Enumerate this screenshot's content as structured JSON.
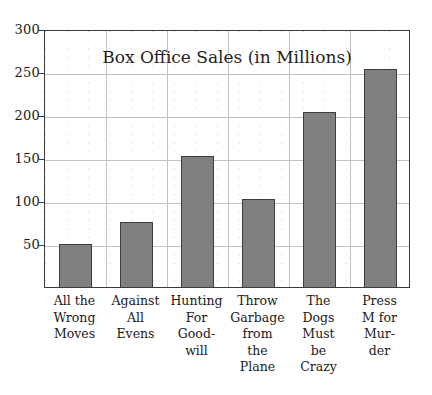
{
  "chart_data": {
    "type": "bar",
    "title": "Box Office Sales (in Millions)",
    "xlabel": "",
    "ylabel": "",
    "ylim": [
      0,
      300
    ],
    "yticks": [
      50,
      100,
      150,
      200,
      250,
      300
    ],
    "grid": true,
    "legend": false,
    "categories": [
      "All the Wrong Moves",
      "Against All Evens",
      "Hunting For Good-will",
      "Throw Garbage from the Plane",
      "The Dogs Must be Crazy",
      "Press M for Mur-der"
    ],
    "category_lines": [
      [
        "All the",
        "Wrong",
        "Moves"
      ],
      [
        "Against",
        "All",
        "Evens"
      ],
      [
        "Hunting",
        "For",
        "Good-",
        "will"
      ],
      [
        "Throw",
        "Garbage",
        "from",
        "the",
        "Plane"
      ],
      [
        "The",
        "Dogs",
        "Must",
        "be",
        "Crazy"
      ],
      [
        "Press",
        "M for",
        "Mur-",
        "der"
      ]
    ],
    "values": [
      50,
      76,
      152,
      102,
      203,
      253
    ],
    "bar_color": "#808080",
    "bar_border_color": "#3d3d3d",
    "grid_color": "#c2c2c2",
    "axis_color": "#3a3a3a"
  }
}
